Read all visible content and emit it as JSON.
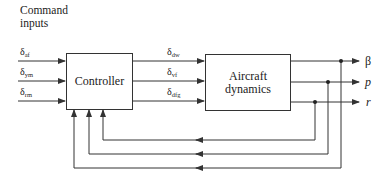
{
  "diagram": {
    "title_line1": "Command",
    "title_line2": "inputs",
    "blocks": {
      "controller": "Controller",
      "aircraft_line1": "Aircraft",
      "aircraft_line2": "dynamics"
    },
    "command_inputs": [
      {
        "symbol": "δ",
        "sub": "af"
      },
      {
        "symbol": "δ",
        "sub": "ym"
      },
      {
        "symbol": "δ",
        "sub": "rm"
      }
    ],
    "control_signals": [
      {
        "symbol": "δ",
        "sub": "dw"
      },
      {
        "symbol": "δ",
        "sub": "vf"
      },
      {
        "symbol": "δ",
        "sub": "dfg"
      }
    ],
    "outputs": [
      {
        "symbol": "β"
      },
      {
        "symbol": "p"
      },
      {
        "symbol": "r"
      }
    ],
    "line_color": "#333333"
  }
}
